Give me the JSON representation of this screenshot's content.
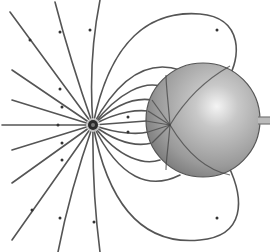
{
  "figure": {
    "point_charge": {
      "cx": 93,
      "cy": 125,
      "r": 5,
      "color": "#2a2a2a"
    },
    "sphere": {
      "cx": 203,
      "cy": 120,
      "r": 57,
      "color_light": "#f2f2f2",
      "color_mid": "#a6a6a6",
      "color_dark": "#6a6a6a",
      "outline": "#555555"
    },
    "ground_rod": {
      "x": 258,
      "y1": 118,
      "y2": 123,
      "x_end": 270,
      "color": "#8a8a8a"
    },
    "line_color": "#555555",
    "background": "#ffffff"
  }
}
